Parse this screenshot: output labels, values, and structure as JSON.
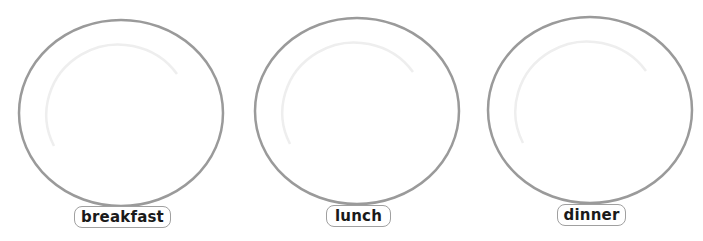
{
  "plates": [
    {
      "label": "breakfast"
    },
    {
      "label": "lunch"
    },
    {
      "label": "dinner"
    }
  ],
  "colors": {
    "rim": "#9a9a9a",
    "inner_rim": "#eeeeee",
    "label_border": "#a0a0a0"
  }
}
